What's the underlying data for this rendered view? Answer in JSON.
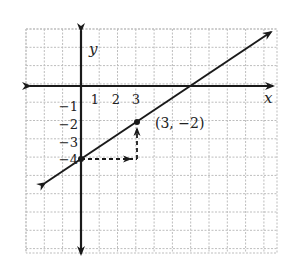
{
  "diagram": {
    "type": "coordinate-plane-line-graph",
    "axes": {
      "x_label": "x",
      "y_label": "y",
      "x_tick_labels": [
        "1",
        "2",
        "3"
      ],
      "y_tick_labels": [
        "−1",
        "−2",
        "−3",
        "−4"
      ]
    },
    "line": {
      "description": "line through (0, -4) and (3, -2)",
      "slope": "2/3",
      "y_intercept": -4
    },
    "points": [
      {
        "name": "y-intercept",
        "x": 0,
        "y": -4
      },
      {
        "name": "labeled-point",
        "x": 3,
        "y": -2,
        "label": "(3, −2)"
      }
    ],
    "slope_guides": {
      "run": "right 3 (dashed arrow)",
      "rise": "up 2 (dashed arrow)"
    },
    "colors": {
      "grid": "#bdbdbd",
      "ink": "#1a1a1a",
      "background": "#ffffff"
    }
  }
}
